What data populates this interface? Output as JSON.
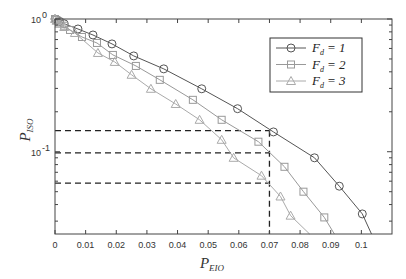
{
  "chart_data": {
    "type": "line",
    "title": "",
    "xlabel": "P_EIO",
    "xlabel_main": "P",
    "xlabel_sub": "EIO",
    "ylabel": "P_ISO",
    "ylabel_main": "P",
    "ylabel_sub": "ISO",
    "xscale": "linear",
    "yscale": "log",
    "xlim": [
      0,
      0.11
    ],
    "ylim": [
      0.024,
      1
    ],
    "grid": false,
    "legend_position": "upper right",
    "x_ticks": [
      0,
      0.01,
      0.02,
      0.03,
      0.04,
      0.05,
      0.06,
      0.07,
      0.08,
      0.09,
      0.1
    ],
    "x_tick_labels": [
      "0",
      "0.01",
      "0.02",
      "0.03",
      "0.04",
      "0.05",
      "0.06",
      "0.07",
      "0.08",
      "0.09",
      "0.1"
    ],
    "y_ticks": [
      1,
      0.1
    ],
    "y_tick_labels": [
      {
        "base": "10",
        "exp": "0"
      },
      {
        "base": "10",
        "exp": "-1"
      }
    ],
    "series": [
      {
        "name": "F_d = 1",
        "legend_main": "F",
        "legend_sub": "d",
        "legend_value": "= 1",
        "marker": "circle",
        "color": "#555555",
        "x": [
          0,
          0.0005,
          0.0015,
          0.003,
          0.0075,
          0.0124,
          0.0186,
          0.0257,
          0.0355,
          0.0479,
          0.0596,
          0.0713,
          0.0847,
          0.0928,
          0.1003,
          0.1033
        ],
        "y": [
          1,
          0.99,
          0.96,
          0.92,
          0.841,
          0.758,
          0.649,
          0.527,
          0.421,
          0.298,
          0.211,
          0.141,
          0.09,
          0.055,
          0.034,
          0.024
        ],
        "markers_at": [
          0,
          1,
          2,
          3,
          4,
          5,
          6,
          7,
          8,
          9,
          10,
          11,
          12,
          13,
          14
        ]
      },
      {
        "name": "F_d = 2",
        "legend_main": "F",
        "legend_sub": "d",
        "legend_value": "= 2",
        "marker": "square",
        "color": "#999999",
        "x": [
          0,
          0.0005,
          0.0015,
          0.003,
          0.0049,
          0.0088,
          0.0137,
          0.0189,
          0.0264,
          0.0342,
          0.045,
          0.0544,
          0.0664,
          0.0749,
          0.0811,
          0.0879,
          0.0912
        ],
        "y": [
          1,
          0.98,
          0.94,
          0.89,
          0.827,
          0.732,
          0.66,
          0.536,
          0.443,
          0.348,
          0.246,
          0.174,
          0.119,
          0.077,
          0.05,
          0.032,
          0.024
        ],
        "markers_at": [
          0,
          1,
          2,
          3,
          4,
          5,
          6,
          7,
          8,
          9,
          10,
          11,
          12,
          13,
          14,
          15
        ]
      },
      {
        "name": "F_d = 3",
        "legend_main": "F",
        "legend_sub": "d",
        "legend_value": "= 3",
        "marker": "triangle",
        "color": "#aaaaaa",
        "x": [
          0,
          0.0005,
          0.0015,
          0.003,
          0.0065,
          0.014,
          0.0195,
          0.025,
          0.0313,
          0.0394,
          0.0472,
          0.0544,
          0.0583,
          0.0674,
          0.0736,
          0.0769,
          0.0831
        ],
        "y": [
          1,
          0.97,
          0.92,
          0.87,
          0.785,
          0.555,
          0.475,
          0.38,
          0.298,
          0.229,
          0.174,
          0.123,
          0.09,
          0.066,
          0.046,
          0.033,
          0.024
        ],
        "markers_at": [
          0,
          1,
          2,
          3,
          4,
          5,
          6,
          7,
          8,
          9,
          10,
          11,
          12,
          13,
          14,
          15
        ]
      }
    ],
    "annotations": {
      "vertical_dashed": {
        "x": 0.07,
        "y_from": 0.024,
        "y_to": 0.144
      },
      "horizontal_dashed": [
        {
          "y": 0.144,
          "x_from": 0,
          "x_to": 0.07,
          "series": "F_d = 1"
        },
        {
          "y": 0.098,
          "x_from": 0,
          "x_to": 0.07,
          "series": "F_d = 2"
        },
        {
          "y": 0.058,
          "x_from": 0,
          "x_to": 0.07,
          "series": "F_d = 3"
        }
      ]
    }
  },
  "layout": {
    "plot": {
      "left": 55,
      "right": 392,
      "top": 19,
      "bottom": 234
    },
    "legend": {
      "left": 270,
      "top": 38,
      "width": 92,
      "height": 54
    }
  }
}
